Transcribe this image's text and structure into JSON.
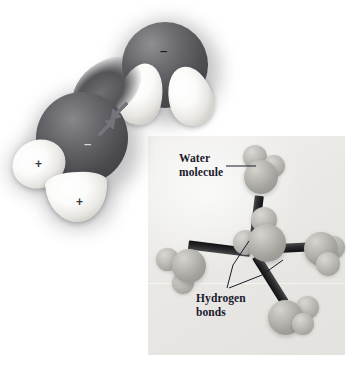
{
  "figure": {
    "background_color": "#ffffff"
  },
  "main_diagram": {
    "name": "space-filling model of two hydrogen-bonded water molecules",
    "molecules": [
      {
        "id": "upper-water",
        "oxygen": {
          "charge_label": "–",
          "color": "#4e4e53"
        },
        "hydrogens": [
          {
            "id": "upper-h-left",
            "charge_label": "",
            "color": "#ffffff"
          },
          {
            "id": "upper-h-right",
            "charge_label": "",
            "color": "#ffffff"
          }
        ]
      },
      {
        "id": "lower-water",
        "oxygen": {
          "charge_label": "–",
          "color": "#4a4a4f"
        },
        "hydrogens": [
          {
            "id": "lower-h-left",
            "charge_label": "+",
            "color": "#ffffff"
          },
          {
            "id": "lower-h-bottom",
            "charge_label": "+",
            "color": "#ffffff"
          }
        ]
      }
    ],
    "bond_arrow": {
      "name": "hydrogen-bond double arrow",
      "direction": "double-headed, diagonal",
      "color": "#6e6e73"
    },
    "charges": {
      "negative": "–",
      "positive": "+"
    }
  },
  "inset": {
    "name": "tetrahedral hydrogen bonding inset",
    "background_color": "#ebeae7",
    "labels": {
      "water_molecule": "Water\nmolecule",
      "hydrogen_bonds": "Hydrogen\nbonds"
    },
    "label_color": "#19192b",
    "molecules": [
      {
        "id": "central-water",
        "role": "central"
      },
      {
        "id": "top-water",
        "role": "neighbor"
      },
      {
        "id": "left-water",
        "role": "neighbor"
      },
      {
        "id": "right-water",
        "role": "neighbor"
      },
      {
        "id": "bottom-right-water",
        "role": "neighbor"
      }
    ],
    "bond_count": 4,
    "bond_color": "#1f1f22"
  }
}
